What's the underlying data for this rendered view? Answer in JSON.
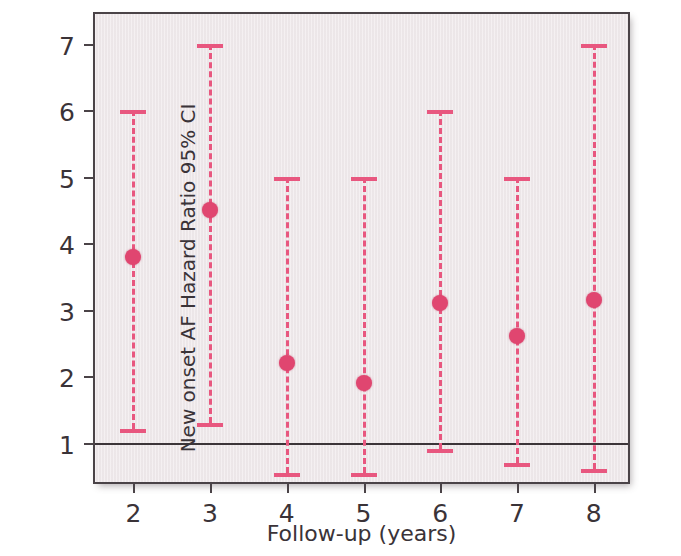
{
  "chart_data": {
    "type": "scatter",
    "title": "",
    "xlabel": "Follow-up (years)",
    "ylabel": "New onset AF Hazard Ratio 95% CI",
    "xlim": [
      1.5,
      8.5
    ],
    "ylim": [
      0.35,
      7.45
    ],
    "xticks": [
      2,
      3,
      4,
      5,
      6,
      7,
      8
    ],
    "xtick_labels": [
      "2",
      "3",
      "4",
      "5",
      "6",
      "7",
      "8"
    ],
    "yticks": [
      1,
      2,
      3,
      4,
      5,
      6,
      7
    ],
    "ytick_labels": [
      "1",
      "2",
      "3",
      "4",
      "5",
      "6",
      "7"
    ],
    "grid": false,
    "legend": "none",
    "reference_line": {
      "value": 1,
      "style": "solid",
      "color": "#3c3539",
      "label": ""
    },
    "marker_color": "#e04670",
    "errorbar_color": "#e8577f",
    "errorbar_style": "dashed",
    "plot_background": "#f0eaec",
    "axis_color": "#4a4347",
    "categories": [
      "2",
      "3",
      "4",
      "5",
      "6",
      "7",
      "8"
    ],
    "x": [
      2,
      3,
      4,
      5,
      6,
      7,
      8
    ],
    "values": [
      3.8,
      4.5,
      2.2,
      1.9,
      3.1,
      2.6,
      3.15
    ],
    "ci_lower": [
      1.2,
      1.3,
      0.55,
      0.55,
      0.9,
      0.7,
      0.6
    ],
    "ci_upper": [
      6.0,
      7.0,
      5.0,
      5.0,
      6.0,
      5.0,
      7.0
    ],
    "points": [
      {
        "x": 2,
        "hr": 3.8,
        "lower": 1.2,
        "upper": 6.0
      },
      {
        "x": 3,
        "hr": 4.5,
        "lower": 1.3,
        "upper": 7.0
      },
      {
        "x": 4,
        "hr": 2.2,
        "lower": 0.55,
        "upper": 5.0
      },
      {
        "x": 5,
        "hr": 1.9,
        "lower": 0.55,
        "upper": 5.0
      },
      {
        "x": 6,
        "hr": 3.1,
        "lower": 0.9,
        "upper": 6.0
      },
      {
        "x": 7,
        "hr": 2.6,
        "lower": 0.7,
        "upper": 5.0
      },
      {
        "x": 8,
        "hr": 3.15,
        "lower": 0.6,
        "upper": 7.0
      }
    ]
  },
  "watermark": {
    "line1": "",
    "line2": ""
  }
}
